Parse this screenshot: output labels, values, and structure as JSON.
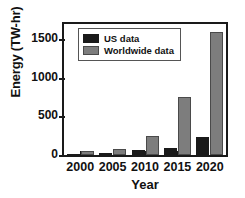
{
  "chart_data": {
    "type": "bar",
    "title": "",
    "xlabel": "Year",
    "ylabel": "Energy (TW-hr)",
    "categories": [
      "2000",
      "2005",
      "2010",
      "2015",
      "2020"
    ],
    "series": [
      {
        "name": "US data",
        "color": "#1a1a1a",
        "values": [
          15,
          20,
          70,
          95,
          240
        ]
      },
      {
        "name": "Worldwide data",
        "color": "#7d7d7d",
        "values": [
          50,
          75,
          250,
          750,
          1600
        ]
      }
    ],
    "ylim": [
      0,
      1700
    ],
    "yticks": [
      0,
      500,
      1000,
      1500
    ],
    "ytick_labels": [
      "0",
      "500",
      "1000",
      "1500"
    ],
    "xtick_labels": [
      "2000",
      "2005",
      "2010",
      "2015",
      "2020"
    ],
    "grid": false,
    "legend_position": "top-left"
  },
  "legend": {
    "items": [
      {
        "label": "US data"
      },
      {
        "label": "Worldwide data"
      }
    ]
  },
  "axes": {
    "y_title": "Energy (TW-hr)",
    "x_title": "Year"
  }
}
